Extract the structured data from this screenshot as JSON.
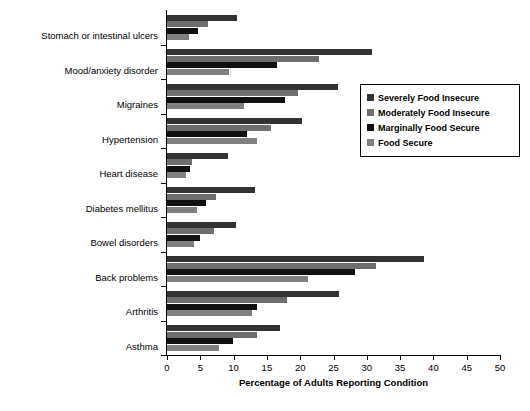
{
  "chart_data": {
    "type": "bar",
    "orientation": "horizontal",
    "title": "",
    "xlabel": "Percentage of Adults Reporting Condition",
    "ylabel": "",
    "xlim": [
      0,
      50
    ],
    "xticks": [
      0,
      5,
      10,
      15,
      20,
      25,
      30,
      35,
      40,
      45,
      50
    ],
    "grid": false,
    "legend_position": "right",
    "categories": [
      "Stomach or intestinal ulcers",
      "Mood/anxiety disorder",
      "Migraines",
      "Hypertension",
      "Heart disease",
      "Diabetes mellitus",
      "Bowel disorders",
      "Back problems",
      "Arthritis",
      "Asthma"
    ],
    "series": [
      {
        "name": "Severely Food Insecure",
        "color": "#333333",
        "values": [
          10.5,
          30.8,
          25.7,
          20.3,
          9.2,
          13.2,
          10.3,
          38.6,
          25.8,
          17.0
        ]
      },
      {
        "name": "Moderately Food Insecure",
        "color": "#6e6e6e",
        "values": [
          6.2,
          22.8,
          19.7,
          15.6,
          3.7,
          7.3,
          7.1,
          31.4,
          18.0,
          13.5
        ]
      },
      {
        "name": "Marginally Food Secure",
        "color": "#111111",
        "values": [
          4.7,
          16.5,
          17.7,
          12.0,
          3.4,
          5.8,
          5.0,
          28.2,
          13.5,
          9.9
        ]
      },
      {
        "name": "Food Secure",
        "color": "#808080",
        "values": [
          3.3,
          9.3,
          11.6,
          13.5,
          2.8,
          4.5,
          4.1,
          21.2,
          12.8,
          7.8
        ]
      }
    ]
  },
  "legend": {
    "items": [
      {
        "label": "Severely Food Insecure"
      },
      {
        "label": "Moderately Food Insecure"
      },
      {
        "label": "Marginally Food Secure"
      },
      {
        "label": "Food Secure"
      }
    ]
  }
}
